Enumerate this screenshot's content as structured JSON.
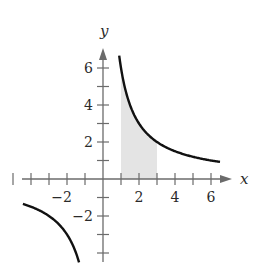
{
  "chart_data": {
    "type": "line",
    "title": "",
    "function": "y = 6/x",
    "xlabel": "x",
    "ylabel": "y",
    "xlim": [
      -5.5,
      7
    ],
    "ylim": [
      -5,
      7
    ],
    "grid": false,
    "legend": null,
    "x_ticks": [
      -5,
      -4,
      -3,
      -2,
      -1,
      1,
      2,
      3,
      4,
      5,
      6
    ],
    "x_tick_labels": {
      "-2": "−2",
      "2": "2",
      "4": "4",
      "6": "6"
    },
    "y_ticks": [
      -4,
      -3,
      -2,
      -1,
      1,
      2,
      3,
      4,
      5,
      6
    ],
    "y_tick_labels": {
      "-2": "−2",
      "2": "2",
      "4": "4",
      "6": "6"
    },
    "series": [
      {
        "name": "branch-positive",
        "x": [
          0.9,
          1,
          1.5,
          2,
          2.5,
          3,
          4,
          5,
          6,
          6.5
        ],
        "y": [
          6.67,
          6,
          4,
          3,
          2.4,
          2,
          1.5,
          1.2,
          1,
          0.92
        ]
      },
      {
        "name": "branch-negative",
        "x": [
          -4.5,
          -4,
          -3,
          -2,
          -1.5,
          -1.33
        ],
        "y": [
          -1.33,
          -1.5,
          -2,
          -3,
          -4,
          -4.5
        ]
      }
    ],
    "shaded_region": {
      "from_x": 1,
      "to_x": 3,
      "under": "y = 6/x",
      "color": "#e4e4e4"
    }
  },
  "axes": {
    "x_name": "x",
    "y_name": "y",
    "x_labels": [
      {
        "value": -2,
        "text": "−2"
      },
      {
        "value": 2,
        "text": "2"
      },
      {
        "value": 4,
        "text": "4"
      },
      {
        "value": 6,
        "text": "6"
      }
    ],
    "y_labels": [
      {
        "value": 6,
        "text": "6"
      },
      {
        "value": 4,
        "text": "4"
      },
      {
        "value": 2,
        "text": "2"
      },
      {
        "value": -2,
        "text": "−2"
      }
    ]
  },
  "colors": {
    "curve": "#111111",
    "axis": "#6b6b6b",
    "shade": "#e4e4e4"
  }
}
